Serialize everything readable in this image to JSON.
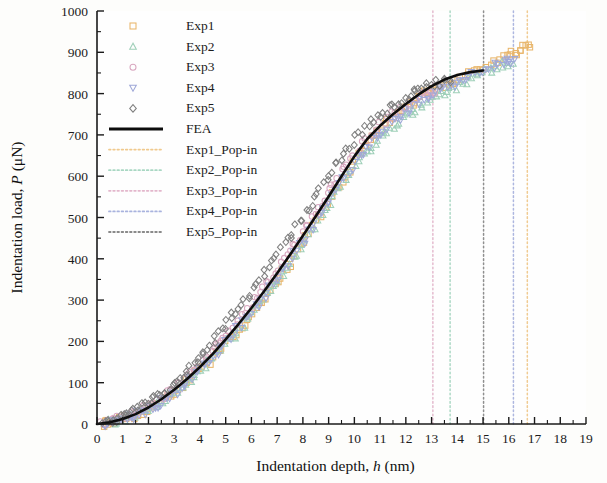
{
  "chart_data": {
    "type": "scatter",
    "title": "",
    "xlabel": "Indentation depth, h (nm)",
    "xlabel_main": "Indentation depth,",
    "xlabel_italic": "h",
    "xlabel_unit": "(nm)",
    "ylabel": "Indentation load, P (μN)",
    "ylabel_main": "Indentation load,",
    "ylabel_italic": "P",
    "ylabel_unit": "(μN)",
    "xlim": [
      0,
      19
    ],
    "ylim": [
      0,
      1000
    ],
    "xticks": [
      0,
      1,
      2,
      3,
      4,
      5,
      6,
      7,
      8,
      9,
      10,
      11,
      12,
      13,
      14,
      15,
      16,
      17,
      18,
      19
    ],
    "yticks": [
      0,
      100,
      200,
      300,
      400,
      500,
      600,
      700,
      800,
      900,
      1000
    ],
    "xminor_step": 0.5,
    "yminor_step": 50,
    "grid": false,
    "legend_position": "top-left-inside",
    "series": [
      {
        "name": "Exp1",
        "marker": "square",
        "color": "#e8b56a",
        "x_end": 16.75,
        "y_end": 920,
        "x": [
          0.25,
          0.45,
          0.7,
          0.95,
          1.2,
          1.5,
          1.8,
          2.1,
          2.4,
          2.75,
          3.05,
          3.4,
          3.7,
          4.0,
          4.35,
          4.7,
          5.0,
          5.35,
          5.7,
          6.05,
          6.4,
          6.75,
          7.1,
          7.45,
          7.8,
          8.15,
          8.5,
          8.85,
          9.2,
          9.55,
          9.9,
          10.25,
          10.6,
          10.95,
          11.3,
          11.65,
          12.0,
          12.35,
          12.7,
          13.05,
          13.4,
          13.75,
          14.1,
          14.5,
          14.9,
          15.3,
          15.7,
          16.05,
          16.35,
          16.6,
          16.75
        ],
        "y": [
          2,
          4,
          7,
          11,
          16,
          22,
          30,
          40,
          52,
          65,
          80,
          96,
          114,
          132,
          152,
          174,
          196,
          220,
          246,
          272,
          300,
          328,
          358,
          388,
          420,
          452,
          486,
          520,
          556,
          592,
          628,
          660,
          690,
          712,
          730,
          748,
          766,
          784,
          800,
          812,
          820,
          828,
          838,
          850,
          862,
          872,
          882,
          894,
          905,
          915,
          920
        ]
      },
      {
        "name": "Exp2",
        "marker": "triangle-up",
        "color": "#9ecfb8",
        "x_end": 16.1,
        "y_end": 875,
        "x": [
          0.3,
          0.55,
          0.8,
          1.05,
          1.35,
          1.65,
          1.95,
          2.25,
          2.6,
          2.9,
          3.2,
          3.55,
          3.85,
          4.2,
          4.5,
          4.85,
          5.2,
          5.55,
          5.9,
          6.25,
          6.6,
          6.95,
          7.3,
          7.65,
          8.0,
          8.35,
          8.7,
          9.05,
          9.4,
          9.75,
          10.1,
          10.45,
          10.8,
          11.15,
          11.5,
          11.85,
          12.2,
          12.55,
          12.9,
          13.25,
          13.6,
          13.95,
          14.3,
          14.7,
          15.1,
          15.5,
          15.8,
          16.1
        ],
        "y": [
          2,
          5,
          8,
          12,
          18,
          25,
          34,
          44,
          57,
          70,
          85,
          102,
          120,
          140,
          160,
          183,
          206,
          231,
          257,
          284,
          312,
          341,
          371,
          402,
          434,
          467,
          500,
          534,
          568,
          600,
          630,
          656,
          680,
          700,
          718,
          736,
          752,
          768,
          784,
          796,
          806,
          816,
          828,
          840,
          852,
          862,
          870,
          875
        ]
      },
      {
        "name": "Exp3",
        "marker": "circle",
        "color": "#d9a8c0",
        "x_end": 13.05,
        "y_end": 800,
        "x": [
          0.2,
          0.4,
          0.65,
          0.9,
          1.15,
          1.45,
          1.75,
          2.05,
          2.35,
          2.7,
          3.0,
          3.35,
          3.65,
          3.95,
          4.3,
          4.65,
          4.95,
          5.3,
          5.65,
          6.0,
          6.35,
          6.7,
          7.05,
          7.4,
          7.75,
          8.1,
          8.45,
          8.8,
          9.15,
          9.5,
          9.85,
          10.2,
          10.55,
          10.9,
          11.25,
          11.6,
          11.95,
          12.3,
          12.65,
          12.9,
          13.05
        ],
        "y": [
          3,
          6,
          9,
          13,
          19,
          26,
          35,
          46,
          58,
          73,
          88,
          106,
          124,
          144,
          165,
          188,
          211,
          236,
          262,
          290,
          318,
          347,
          378,
          409,
          442,
          475,
          509,
          544,
          578,
          610,
          640,
          668,
          694,
          716,
          736,
          754,
          770,
          786,
          796,
          800,
          802
        ]
      },
      {
        "name": "Exp4",
        "marker": "triangle-down",
        "color": "#9fa8d8",
        "x_end": 16.2,
        "y_end": 880,
        "x": [
          0.28,
          0.5,
          0.75,
          1.0,
          1.3,
          1.6,
          1.9,
          2.2,
          2.5,
          2.85,
          3.15,
          3.5,
          3.8,
          4.1,
          4.45,
          4.8,
          5.1,
          5.45,
          5.8,
          6.15,
          6.5,
          6.85,
          7.2,
          7.55,
          7.9,
          8.25,
          8.6,
          8.95,
          9.3,
          9.65,
          10.0,
          10.35,
          10.7,
          11.05,
          11.4,
          11.75,
          12.1,
          12.45,
          12.8,
          13.15,
          13.5,
          13.85,
          14.2,
          14.6,
          15.0,
          15.4,
          15.75,
          16.0,
          16.2
        ],
        "y": [
          2,
          5,
          8,
          12,
          17,
          24,
          33,
          43,
          55,
          69,
          84,
          101,
          119,
          138,
          159,
          181,
          205,
          229,
          255,
          282,
          310,
          340,
          370,
          401,
          433,
          466,
          500,
          534,
          568,
          602,
          632,
          660,
          686,
          708,
          726,
          744,
          760,
          776,
          790,
          802,
          812,
          822,
          833,
          845,
          857,
          866,
          872,
          877,
          880
        ]
      },
      {
        "name": "Exp5",
        "marker": "diamond",
        "color": "#7f7f7f",
        "x_end": 13.75,
        "y_end": 830,
        "x": [
          0.22,
          0.48,
          0.72,
          0.98,
          1.25,
          1.55,
          1.85,
          2.15,
          2.45,
          2.8,
          3.1,
          3.45,
          3.75,
          4.05,
          4.4,
          4.75,
          5.05,
          5.4,
          5.75,
          6.1,
          6.45,
          6.8,
          7.15,
          7.5,
          7.85,
          8.2,
          8.55,
          8.9,
          9.25,
          9.6,
          9.95,
          10.3,
          10.65,
          11.0,
          11.35,
          11.7,
          12.05,
          12.4,
          12.75,
          13.1,
          13.45,
          13.75
        ],
        "y": [
          4,
          8,
          13,
          19,
          26,
          35,
          46,
          58,
          72,
          88,
          106,
          126,
          147,
          169,
          193,
          218,
          244,
          271,
          299,
          328,
          358,
          389,
          421,
          454,
          488,
          522,
          557,
          592,
          626,
          656,
          684,
          708,
          730,
          748,
          764,
          780,
          794,
          808,
          818,
          824,
          828,
          830
        ]
      }
    ],
    "fea": {
      "name": "FEA",
      "color": "#0d0d0d",
      "style": "solid",
      "linewidth": 2.6,
      "x": [
        0,
        0.5,
        1,
        1.5,
        2,
        2.5,
        3,
        3.5,
        4,
        4.5,
        5,
        5.5,
        6,
        6.5,
        7,
        7.5,
        8,
        8.5,
        9,
        9.5,
        10,
        10.5,
        11,
        11.5,
        12,
        12.5,
        13,
        13.5,
        14,
        14.5,
        15
      ],
      "y": [
        0,
        4,
        12,
        24,
        40,
        60,
        83,
        109,
        138,
        170,
        205,
        242,
        281,
        322,
        365,
        410,
        456,
        503,
        551,
        600,
        648,
        690,
        722,
        750,
        775,
        798,
        818,
        834,
        845,
        852,
        856
      ]
    },
    "popin_lines": [
      {
        "name": "Exp1_Pop-in",
        "x": 16.72,
        "color": "#f0c98d",
        "style": "dotted"
      },
      {
        "name": "Exp2_Pop-in",
        "x": 13.72,
        "color": "#a9d7c3",
        "style": "dotted"
      },
      {
        "name": "Exp3_Pop-in",
        "x": 13.05,
        "color": "#e3b7cc",
        "style": "dotted"
      },
      {
        "name": "Exp4_Pop-in",
        "x": 16.18,
        "color": "#a9b3de",
        "style": "dotted"
      },
      {
        "name": "Exp5_Pop-in",
        "x": 15.02,
        "color": "#8a8a8a",
        "style": "dotted"
      }
    ]
  },
  "legend": {
    "entries": [
      {
        "label": "Exp1",
        "kind": "marker",
        "marker": "square",
        "color": "#e8b56a"
      },
      {
        "label": "Exp2",
        "kind": "marker",
        "marker": "triangle-up",
        "color": "#9ecfb8"
      },
      {
        "label": "Exp3",
        "kind": "marker",
        "marker": "circle",
        "color": "#d9a8c0"
      },
      {
        "label": "Exp4",
        "kind": "marker",
        "marker": "triangle-down",
        "color": "#9fa8d8"
      },
      {
        "label": "Exp5",
        "kind": "marker",
        "marker": "diamond",
        "color": "#7f7f7f"
      },
      {
        "label": "FEA",
        "kind": "line-solid",
        "color": "#0d0d0d"
      },
      {
        "label": "Exp1_Pop-in",
        "kind": "line-dotted",
        "color": "#f0c98d"
      },
      {
        "label": "Exp2_Pop-in",
        "kind": "line-dotted",
        "color": "#a9d7c3"
      },
      {
        "label": "Exp3_Pop-in",
        "kind": "line-dotted",
        "color": "#e3b7cc"
      },
      {
        "label": "Exp4_Pop-in",
        "kind": "line-dotted",
        "color": "#a9b3de"
      },
      {
        "label": "Exp5_Pop-in",
        "kind": "line-dotted",
        "color": "#8a8a8a"
      }
    ]
  }
}
